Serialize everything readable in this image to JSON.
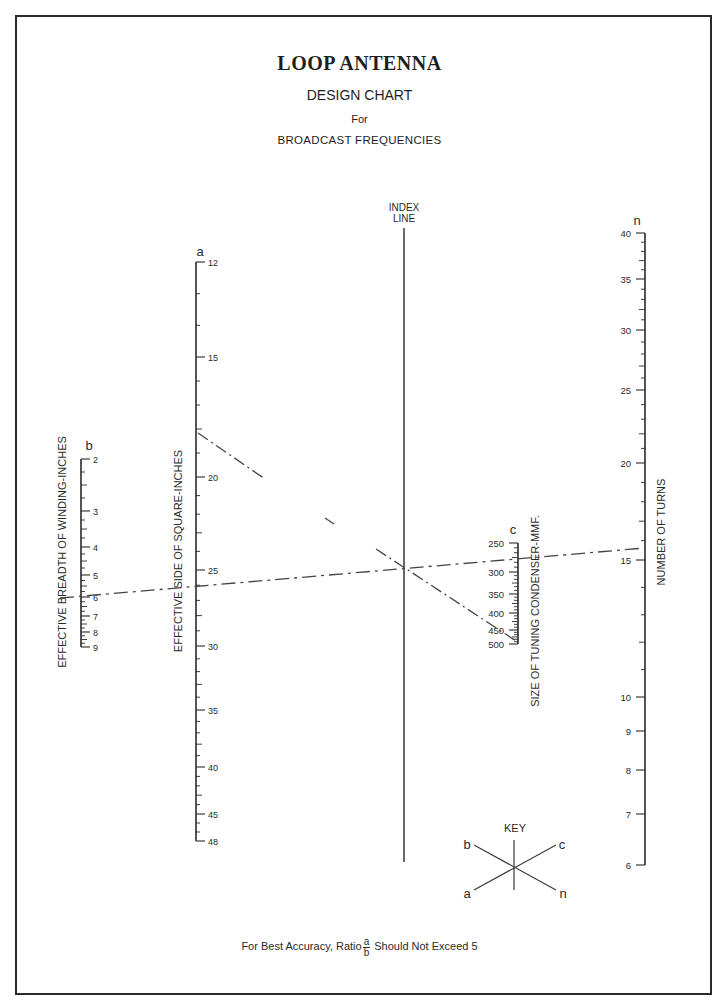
{
  "header": {
    "title": "LOOP ANTENNA",
    "subtitle": "DESIGN CHART",
    "for_text": "For",
    "frequency_text": "BROADCAST FREQUENCIES"
  },
  "footnote": {
    "prefix": "For Best Accuracy, Ratio",
    "frac_num": "a",
    "frac_den": "b",
    "suffix": "Should Not Exceed 5"
  },
  "key": {
    "title": "KEY",
    "labels": {
      "b": "b",
      "c": "c",
      "a": "a",
      "n": "n"
    }
  },
  "chart_data": {
    "type": "nomogram",
    "axes": [
      {
        "id": "b",
        "letter": "b",
        "label": "EFFECTIVE BREADTH OF WINDING-INCHES",
        "range": [
          2,
          9
        ],
        "tick_labels": [
          "2",
          "3",
          "4",
          "5",
          "6",
          "7",
          "8",
          "9"
        ],
        "x": 81,
        "ticks": [
          {
            "v": "2",
            "y": 459
          },
          {
            "v": "3",
            "y": 511
          },
          {
            "v": "4",
            "y": 547
          },
          {
            "v": "5",
            "y": 575
          },
          {
            "v": "6",
            "y": 597
          },
          {
            "v": "7",
            "y": 616
          },
          {
            "v": "8",
            "y": 632
          },
          {
            "v": "9",
            "y": 647
          }
        ]
      },
      {
        "id": "a",
        "letter": "a",
        "label": "EFFECTIVE SIDE OF SQUARE-INCHES",
        "range": [
          12,
          48
        ],
        "tick_labels": [
          "12",
          "15",
          "20",
          "25",
          "30",
          "35",
          "40",
          "45",
          "48"
        ],
        "x": 196,
        "ticks": [
          {
            "v": "12",
            "y": 262
          },
          {
            "v": "15",
            "y": 357
          },
          {
            "v": "20",
            "y": 477
          },
          {
            "v": "25",
            "y": 570
          },
          {
            "v": "30",
            "y": 646
          },
          {
            "v": "35",
            "y": 710
          },
          {
            "v": "40",
            "y": 767
          },
          {
            "v": "45",
            "y": 814
          },
          {
            "v": "48",
            "y": 841
          }
        ]
      },
      {
        "id": "index",
        "label": "INDEX LINE",
        "x": 404,
        "y_top": 228,
        "y_bottom": 862
      },
      {
        "id": "c",
        "letter": "c",
        "label": "SIZE OF TUNING CONDENSER-MMF.",
        "range": [
          250,
          500
        ],
        "tick_labels": [
          "250",
          "300",
          "350",
          "400",
          "450",
          "500"
        ],
        "x": 518,
        "ticks": [
          {
            "v": "250",
            "y": 543
          },
          {
            "v": "300",
            "y": 572
          },
          {
            "v": "350",
            "y": 594
          },
          {
            "v": "400",
            "y": 613
          },
          {
            "v": "450",
            "y": 630
          },
          {
            "v": "500",
            "y": 644
          }
        ]
      },
      {
        "id": "n",
        "letter": "n",
        "label": "NUMBER OF TURNS",
        "range": [
          6,
          40
        ],
        "tick_labels": [
          "40",
          "35",
          "30",
          "25",
          "20",
          "15",
          "10",
          "9",
          "8",
          "7",
          "6"
        ],
        "x": 645,
        "ticks": [
          {
            "v": "40",
            "y": 233
          },
          {
            "v": "35",
            "y": 279
          },
          {
            "v": "30",
            "y": 330
          },
          {
            "v": "25",
            "y": 390
          },
          {
            "v": "20",
            "y": 463
          },
          {
            "v": "15",
            "y": 560
          },
          {
            "v": "10",
            "y": 697
          },
          {
            "v": "9",
            "y": 731
          },
          {
            "v": "8",
            "y": 770
          },
          {
            "v": "7",
            "y": 814
          },
          {
            "v": "6",
            "y": 865
          }
        ]
      }
    ],
    "example_lines": [
      {
        "name": "b-to-n line",
        "style": "long-dash",
        "from": {
          "axis": "b",
          "value": 6
        },
        "through": "index",
        "to": {
          "axis": "n",
          "value": 15.5
        }
      },
      {
        "name": "a-to-c line",
        "style": "dash-dot",
        "from": {
          "axis": "a",
          "value": 18.6
        },
        "through": "index",
        "to": {
          "axis": "c",
          "value": 480
        }
      }
    ],
    "key": "Line b—n and line a—c cross on the index line",
    "note": "For Best Accuracy, Ratio a/b Should Not Exceed 5"
  }
}
